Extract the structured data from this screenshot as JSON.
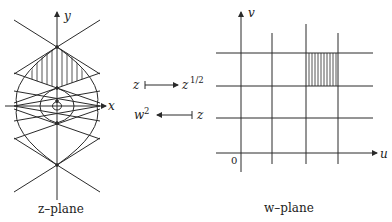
{
  "z_plane": {
    "caption": "z–plane",
    "x_axis_label": "x",
    "y_axis_label": "y"
  },
  "w_plane": {
    "caption": "w–plane",
    "u_axis_label": "u",
    "v_axis_label": "v",
    "origin_label": "0"
  },
  "mappings": {
    "forward_from": "z",
    "forward_to": "z",
    "forward_to_exp": "1/2",
    "inverse_from": "z",
    "inverse_to": "w",
    "inverse_to_exp": "2"
  },
  "colors": {
    "stroke": "#2a2a2a",
    "background": "#ffffff"
  }
}
